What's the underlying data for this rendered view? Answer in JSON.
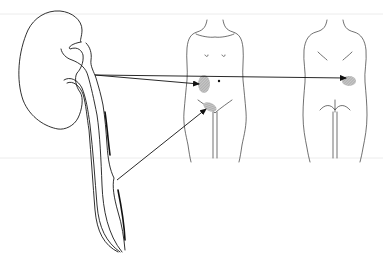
{
  "figure": {
    "elements": [
      {
        "name": "kidney-ureter",
        "label": "Kidney and ureter"
      },
      {
        "name": "front-body",
        "label": "Anterior view"
      },
      {
        "name": "back-body",
        "label": "Posterior view"
      }
    ],
    "arrows": [
      {
        "from": "renal-pelvis",
        "to": "anterior-flank",
        "label": "Flank pain (anterior)"
      },
      {
        "from": "renal-pelvis",
        "to": "posterior-flank",
        "label": "Costovertebral angle pain (posterior)"
      },
      {
        "from": "lower-ureter",
        "to": "groin",
        "label": "Groin pain"
      }
    ],
    "colors": {
      "ink": "#1a1a1a",
      "shading": "#9a9a9a",
      "background": "#ffffff"
    }
  }
}
